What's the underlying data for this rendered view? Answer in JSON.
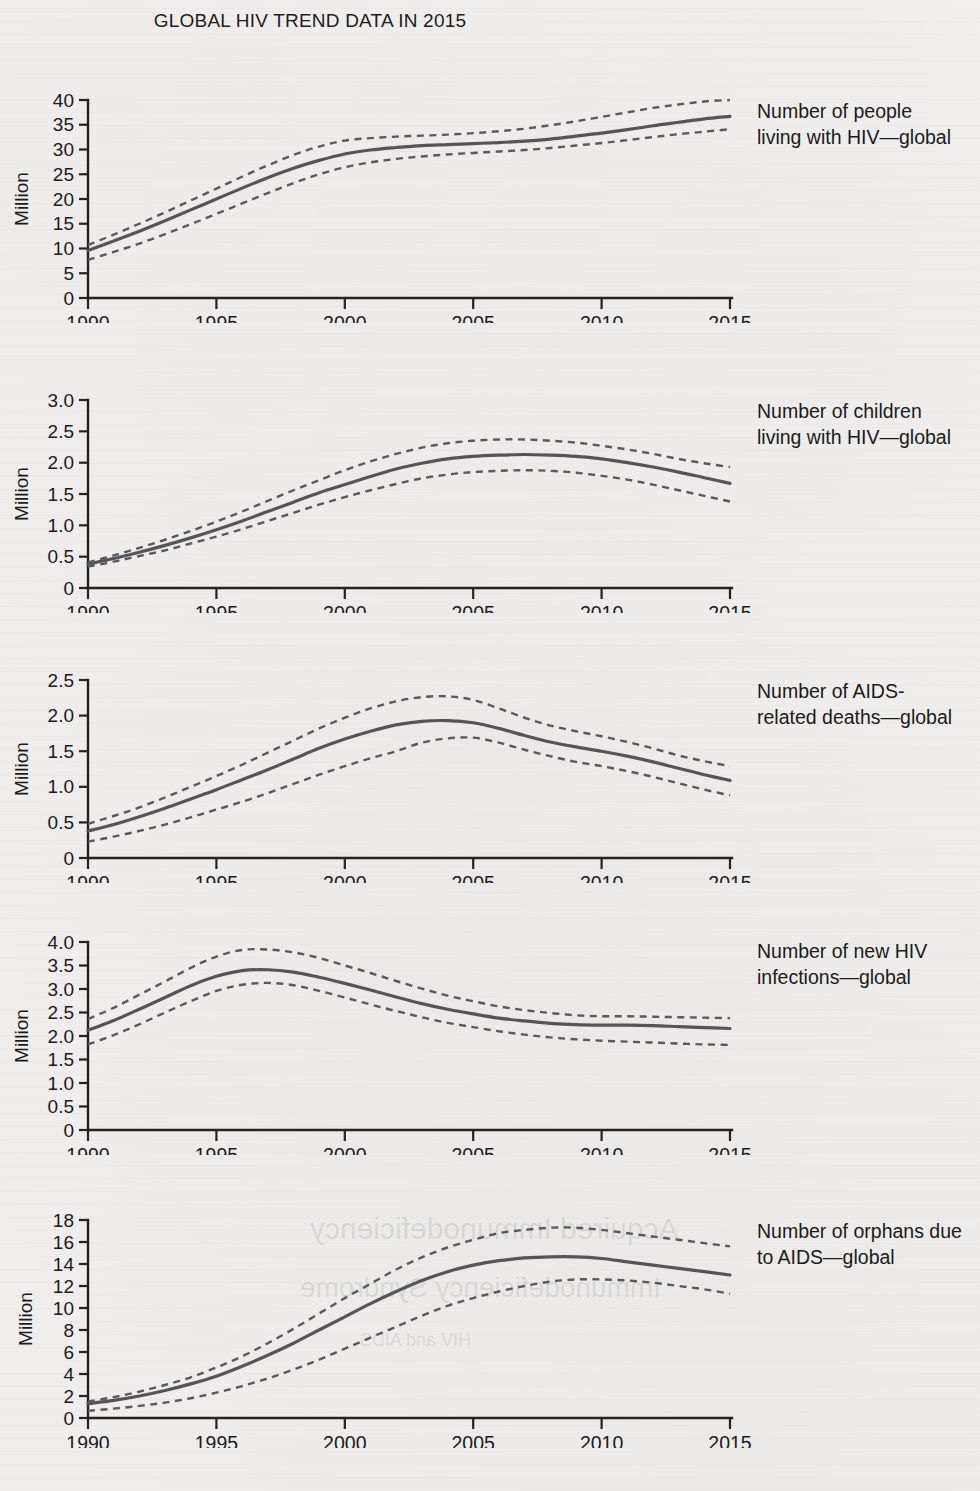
{
  "title": "GLOBAL HIV TREND DATA IN 2015",
  "ylabel": "Million",
  "colors": {
    "line": "#555459",
    "interval": "#5a595e",
    "axis": "#232323",
    "background": "#f2f1ef"
  },
  "panels": [
    {
      "label_line1": "Number of people",
      "label_line2": "living with HIV—global",
      "ylabel": "Million",
      "yticks": [
        "0",
        "5",
        "10",
        "15",
        "20",
        "25",
        "30",
        "35",
        "40"
      ],
      "xticks": [
        "1990",
        "1995",
        "2000",
        "2005",
        "2010",
        "2015"
      ]
    },
    {
      "label_line1": "Number of children",
      "label_line2": "living with HIV—global",
      "ylabel": "Million",
      "yticks": [
        "0",
        "0.5",
        "1.0",
        "1.5",
        "2.0",
        "2.5",
        "3.0"
      ],
      "xticks": [
        "1990",
        "1995",
        "2000",
        "2005",
        "2010",
        "2015"
      ]
    },
    {
      "label_line1": "Number of AIDS-",
      "label_line2": "related deaths—global",
      "ylabel": "Million",
      "yticks": [
        "0",
        "0.5",
        "1.0",
        "1.5",
        "2.0",
        "2.5"
      ],
      "xticks": [
        "1990",
        "1995",
        "2000",
        "2005",
        "2010",
        "2015"
      ]
    },
    {
      "label_line1": "Number of new HIV",
      "label_line2": "infections—global",
      "ylabel": "Million",
      "yticks": [
        "0",
        "0.5",
        "1.0",
        "1.5",
        "2.0",
        "2.5",
        "3.0",
        "3.5",
        "4.0"
      ],
      "xticks": [
        "1990",
        "1995",
        "2000",
        "2005",
        "2010",
        "2015"
      ]
    },
    {
      "label_line1": "Number of orphans due",
      "label_line2": "to AIDS—global",
      "ylabel": "Million",
      "yticks": [
        "0",
        "2",
        "4",
        "6",
        "8",
        "10",
        "12",
        "14",
        "16",
        "18"
      ],
      "xticks": [
        "1990",
        "1995",
        "2000",
        "2005",
        "2010",
        "2015"
      ]
    }
  ],
  "chart_data": [
    {
      "type": "line",
      "title": "Number of people living with HIV—global",
      "xlabel": "",
      "ylabel": "Million",
      "xlim": [
        1990,
        2015
      ],
      "ylim": [
        0,
        40
      ],
      "yticks": [
        0,
        5,
        10,
        15,
        20,
        25,
        30,
        35,
        40
      ],
      "xticks": [
        1990,
        1995,
        2000,
        2005,
        2010,
        2015
      ],
      "grid": false,
      "legend": "none",
      "x": [
        1990,
        1991,
        1992,
        1993,
        1994,
        1995,
        1996,
        1997,
        1998,
        1999,
        2000,
        2001,
        2002,
        2003,
        2004,
        2005,
        2006,
        2007,
        2008,
        2009,
        2010,
        2011,
        2012,
        2013,
        2014,
        2015
      ],
      "series": [
        {
          "name": "estimate",
          "style": "solid",
          "values": [
            9.6,
            11.5,
            13.5,
            15.6,
            17.8,
            20.0,
            22.2,
            24.3,
            26.2,
            27.8,
            29.1,
            29.9,
            30.4,
            30.8,
            31.0,
            31.2,
            31.4,
            31.7,
            32.1,
            32.7,
            33.3,
            34.0,
            34.8,
            35.5,
            36.2,
            36.7
          ]
        },
        {
          "name": "upper bound",
          "style": "dashed",
          "values": [
            10.7,
            12.8,
            15.0,
            17.3,
            19.7,
            22.1,
            24.5,
            26.8,
            28.9,
            30.6,
            31.8,
            32.3,
            32.6,
            32.8,
            33.0,
            33.3,
            33.7,
            34.2,
            34.9,
            35.7,
            36.6,
            37.5,
            38.4,
            39.1,
            39.7,
            40.0
          ]
        },
        {
          "name": "lower bound",
          "style": "dashed",
          "values": [
            7.7,
            9.3,
            11.0,
            12.9,
            14.9,
            17.0,
            19.1,
            21.2,
            23.2,
            25.0,
            26.4,
            27.4,
            28.1,
            28.6,
            29.0,
            29.3,
            29.6,
            29.9,
            30.3,
            30.8,
            31.3,
            31.9,
            32.5,
            33.1,
            33.6,
            34.1
          ]
        }
      ]
    },
    {
      "type": "line",
      "title": "Number of children living with HIV—global",
      "xlabel": "",
      "ylabel": "Million",
      "xlim": [
        1990,
        2015
      ],
      "ylim": [
        0,
        3.0
      ],
      "yticks": [
        0,
        0.5,
        1.0,
        1.5,
        2.0,
        2.5,
        3.0
      ],
      "xticks": [
        1990,
        1995,
        2000,
        2005,
        2010,
        2015
      ],
      "grid": false,
      "legend": "none",
      "x": [
        1990,
        1991,
        1992,
        1993,
        1994,
        1995,
        1996,
        1997,
        1998,
        1999,
        2000,
        2001,
        2002,
        2003,
        2004,
        2005,
        2006,
        2007,
        2008,
        2009,
        2010,
        2011,
        2012,
        2013,
        2014,
        2015
      ],
      "series": [
        {
          "name": "estimate",
          "style": "solid",
          "values": [
            0.38,
            0.47,
            0.57,
            0.68,
            0.8,
            0.93,
            1.07,
            1.22,
            1.37,
            1.52,
            1.65,
            1.78,
            1.9,
            1.99,
            2.06,
            2.1,
            2.12,
            2.13,
            2.12,
            2.1,
            2.06,
            2.0,
            1.93,
            1.85,
            1.76,
            1.67
          ]
        },
        {
          "name": "upper bound",
          "style": "dashed",
          "values": [
            0.41,
            0.52,
            0.64,
            0.77,
            0.91,
            1.06,
            1.22,
            1.39,
            1.56,
            1.72,
            1.88,
            2.02,
            2.14,
            2.24,
            2.31,
            2.35,
            2.37,
            2.37,
            2.35,
            2.32,
            2.27,
            2.21,
            2.14,
            2.06,
            1.99,
            1.93
          ]
        },
        {
          "name": "lower bound",
          "style": "dashed",
          "values": [
            0.34,
            0.42,
            0.51,
            0.6,
            0.71,
            0.82,
            0.94,
            1.07,
            1.2,
            1.33,
            1.45,
            1.56,
            1.66,
            1.75,
            1.81,
            1.85,
            1.87,
            1.88,
            1.87,
            1.84,
            1.79,
            1.73,
            1.65,
            1.56,
            1.47,
            1.38
          ]
        }
      ]
    },
    {
      "type": "line",
      "title": "Number of AIDS-related deaths—global",
      "xlabel": "",
      "ylabel": "Million",
      "xlim": [
        1990,
        2015
      ],
      "ylim": [
        0,
        2.5
      ],
      "yticks": [
        0,
        0.5,
        1.0,
        1.5,
        2.0,
        2.5
      ],
      "xticks": [
        1990,
        1995,
        2000,
        2005,
        2010,
        2015
      ],
      "grid": false,
      "legend": "none",
      "x": [
        1990,
        1991,
        1992,
        1993,
        1994,
        1995,
        1996,
        1997,
        1998,
        1999,
        2000,
        2001,
        2002,
        2003,
        2004,
        2005,
        2006,
        2007,
        2008,
        2009,
        2010,
        2011,
        2012,
        2013,
        2014,
        2015
      ],
      "series": [
        {
          "name": "estimate",
          "style": "solid",
          "values": [
            0.38,
            0.47,
            0.58,
            0.7,
            0.83,
            0.96,
            1.1,
            1.24,
            1.39,
            1.54,
            1.67,
            1.78,
            1.87,
            1.92,
            1.93,
            1.9,
            1.82,
            1.72,
            1.63,
            1.56,
            1.5,
            1.43,
            1.35,
            1.26,
            1.17,
            1.09
          ]
        },
        {
          "name": "upper bound",
          "style": "dashed",
          "values": [
            0.48,
            0.59,
            0.71,
            0.85,
            1.0,
            1.15,
            1.31,
            1.48,
            1.65,
            1.82,
            1.97,
            2.1,
            2.2,
            2.26,
            2.27,
            2.22,
            2.1,
            1.97,
            1.86,
            1.78,
            1.71,
            1.63,
            1.54,
            1.44,
            1.36,
            1.29
          ]
        },
        {
          "name": "lower bound",
          "style": "dashed",
          "values": [
            0.23,
            0.3,
            0.38,
            0.47,
            0.57,
            0.68,
            0.79,
            0.91,
            1.04,
            1.17,
            1.29,
            1.4,
            1.5,
            1.62,
            1.68,
            1.69,
            1.62,
            1.52,
            1.43,
            1.35,
            1.29,
            1.22,
            1.14,
            1.05,
            0.96,
            0.88
          ]
        }
      ]
    },
    {
      "type": "line",
      "title": "Number of new HIV infections—global",
      "xlabel": "",
      "ylabel": "Million",
      "xlim": [
        1990,
        2015
      ],
      "ylim": [
        0,
        4.0
      ],
      "yticks": [
        0,
        0.5,
        1.0,
        1.5,
        2.0,
        2.5,
        3.0,
        3.5,
        4.0
      ],
      "xticks": [
        1990,
        1995,
        2000,
        2005,
        2010,
        2015
      ],
      "grid": false,
      "legend": "none",
      "x": [
        1990,
        1991,
        1992,
        1993,
        1994,
        1995,
        1996,
        1997,
        1998,
        1999,
        2000,
        2001,
        2002,
        2003,
        2004,
        2005,
        2006,
        2007,
        2008,
        2009,
        2010,
        2011,
        2012,
        2013,
        2014,
        2015
      ],
      "series": [
        {
          "name": "estimate",
          "style": "solid",
          "values": [
            2.12,
            2.33,
            2.57,
            2.82,
            3.07,
            3.27,
            3.39,
            3.41,
            3.36,
            3.25,
            3.12,
            2.98,
            2.83,
            2.69,
            2.57,
            2.47,
            2.38,
            2.32,
            2.27,
            2.24,
            2.23,
            2.23,
            2.22,
            2.2,
            2.18,
            2.16
          ]
        },
        {
          "name": "upper bound",
          "style": "dashed",
          "values": [
            2.36,
            2.6,
            2.88,
            3.16,
            3.45,
            3.69,
            3.83,
            3.84,
            3.78,
            3.66,
            3.5,
            3.34,
            3.17,
            3.01,
            2.86,
            2.74,
            2.63,
            2.55,
            2.49,
            2.44,
            2.42,
            2.42,
            2.41,
            2.4,
            2.39,
            2.38
          ]
        },
        {
          "name": "lower bound",
          "style": "dashed",
          "values": [
            1.82,
            2.02,
            2.25,
            2.5,
            2.74,
            2.96,
            3.09,
            3.13,
            3.08,
            2.96,
            2.82,
            2.67,
            2.53,
            2.4,
            2.28,
            2.19,
            2.1,
            2.03,
            1.97,
            1.93,
            1.9,
            1.88,
            1.86,
            1.84,
            1.82,
            1.81
          ]
        }
      ]
    },
    {
      "type": "line",
      "title": "Number of orphans due to AIDS—global",
      "xlabel": "",
      "ylabel": "Million",
      "xlim": [
        1990,
        2015
      ],
      "ylim": [
        0,
        18
      ],
      "yticks": [
        0,
        2,
        4,
        6,
        8,
        10,
        12,
        14,
        16,
        18
      ],
      "xticks": [
        1990,
        1995,
        2000,
        2005,
        2010,
        2015
      ],
      "grid": false,
      "legend": "none",
      "x": [
        1990,
        1991,
        1992,
        1993,
        1994,
        1995,
        1996,
        1997,
        1998,
        1999,
        2000,
        2001,
        2002,
        2003,
        2004,
        2005,
        2006,
        2007,
        2008,
        2009,
        2010,
        2011,
        2012,
        2013,
        2014,
        2015
      ],
      "series": [
        {
          "name": "estimate",
          "style": "solid",
          "values": [
            1.3,
            1.6,
            2.0,
            2.5,
            3.1,
            3.8,
            4.7,
            5.7,
            6.8,
            8.0,
            9.2,
            10.4,
            11.5,
            12.5,
            13.3,
            13.9,
            14.3,
            14.55,
            14.65,
            14.65,
            14.5,
            14.2,
            13.9,
            13.6,
            13.3,
            13.0
          ]
        },
        {
          "name": "upper bound",
          "style": "dashed",
          "values": [
            1.5,
            1.9,
            2.4,
            3.0,
            3.7,
            4.6,
            5.6,
            6.8,
            8.1,
            9.5,
            10.9,
            12.2,
            13.5,
            14.6,
            15.5,
            16.2,
            16.8,
            17.1,
            17.3,
            17.3,
            17.1,
            16.8,
            16.5,
            16.2,
            15.9,
            15.6
          ]
        },
        {
          "name": "lower bound",
          "style": "dashed",
          "values": [
            0.65,
            0.85,
            1.1,
            1.4,
            1.8,
            2.3,
            2.9,
            3.6,
            4.4,
            5.3,
            6.3,
            7.3,
            8.3,
            9.3,
            10.2,
            10.9,
            11.5,
            12.0,
            12.4,
            12.6,
            12.6,
            12.5,
            12.3,
            12.0,
            11.7,
            11.3
          ]
        }
      ]
    }
  ],
  "ghost_text": [
    "Acquired Immunodeficiency",
    "Immunodeficiency Syndrome",
    "HIV and AIDS"
  ]
}
